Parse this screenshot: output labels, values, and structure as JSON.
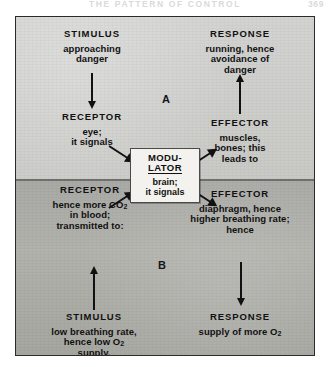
{
  "running_head": {
    "title": "THE PATTERN OF CONTROL",
    "folio": "369"
  },
  "figure": {
    "sections": [
      {
        "letter": "A"
      },
      {
        "letter": "B"
      }
    ],
    "modulator": {
      "title_line1": "MODU-",
      "title_line2": "LATOR",
      "sub_line1": "brain;",
      "sub_line2": "it signals"
    },
    "section_a": {
      "stimulus": {
        "heading": "STIMULUS",
        "line1": "approaching",
        "line2": "danger"
      },
      "receptor": {
        "heading": "RECEPTOR",
        "line1": "eye;",
        "line2": "it signals"
      },
      "effector": {
        "heading": "EFFECTOR",
        "line1": "muscles,",
        "line2": "bones; this",
        "line3": "leads to"
      },
      "response": {
        "heading": "RESPONSE",
        "line1": "running, hence",
        "line2": "avoidance of",
        "line3": "danger"
      }
    },
    "section_b": {
      "receptor": {
        "heading": "RECEPTOR",
        "line1_pre": "hence more CO",
        "line1_sub": "2",
        "line2": "in blood;",
        "line3": "transmitted to:"
      },
      "effector": {
        "heading": "EFFECTOR",
        "line1": "diaphragm, hence",
        "line2": "higher breathing rate;",
        "line3": "hence"
      },
      "stimulus": {
        "heading": "STIMULUS",
        "line1": "low breathing rate,",
        "line2_pre": "hence low O",
        "line2_sub": "2",
        "line3": "supply."
      },
      "response": {
        "heading": "RESPONSE",
        "line1_pre": "supply of more O",
        "line1_sub": "2"
      }
    }
  },
  "colors": {
    "ink": "#111111",
    "panel_a": "#d0d0ce",
    "panel_b": "#aaaaa5",
    "modulator_bg": "#f3f2ee"
  }
}
